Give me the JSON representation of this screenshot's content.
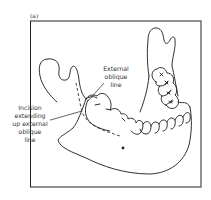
{
  "figure": {
    "panel_label": "(a)",
    "labels": {
      "external_oblique_line": [
        "External",
        "oblique",
        "line"
      ],
      "incision": [
        "Incision",
        "extending",
        "up external",
        "oblique",
        "line"
      ]
    },
    "colors": {
      "line": "#1a1a1a",
      "text": "#333333",
      "background": "#ffffff"
    }
  }
}
